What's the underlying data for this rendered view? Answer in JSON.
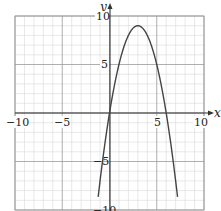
{
  "chart_data": {
    "type": "line",
    "title": "",
    "xlabel": "x",
    "ylabel": "y",
    "xlim": [
      -10,
      10
    ],
    "ylim": [
      -10,
      10
    ],
    "grid": true,
    "grid_minor_step": 1,
    "grid_major_step": 5,
    "x_ticks": [
      "-10",
      "-5",
      "5",
      "10"
    ],
    "y_ticks": [
      "10",
      "5",
      "-5",
      "-10"
    ],
    "series": [
      {
        "name": "y = -x^2 + 6x",
        "equation": "y = -x^2 + 6x",
        "x": [
          -1,
          0,
          1,
          2,
          3,
          4,
          5,
          6,
          7
        ],
        "y": [
          -7,
          0,
          5,
          8,
          9,
          8,
          5,
          0,
          -7
        ],
        "color": "#444444"
      }
    ],
    "key_points": {
      "vertex": [
        3,
        9
      ],
      "x_intercepts": [
        [
          0,
          0
        ],
        [
          6,
          0
        ]
      ]
    }
  },
  "labels": {
    "x_axis": "x",
    "y_axis": "y",
    "tick_neg10_x": "−10",
    "tick_neg5_x": "−5",
    "tick_5_x": "5",
    "tick_10_x": "10",
    "tick_10_y": "10",
    "tick_5_y": "5",
    "tick_neg5_y": "−5",
    "tick_neg10_y": "−10"
  }
}
